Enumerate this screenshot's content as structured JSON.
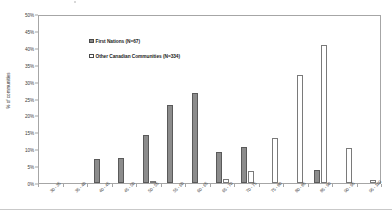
{
  "chart_data": {
    "type": "bar",
    "title": "",
    "subtitle": "",
    "xlabel": "",
    "ylabel": "% of communities",
    "ylim": [
      0,
      50
    ],
    "ytick_labels": [
      "0%",
      "5%",
      "10%",
      "15%",
      "20%",
      "25%",
      "30%",
      "35%",
      "40%",
      "45%",
      "50%"
    ],
    "ytick_values": [
      0,
      5,
      10,
      15,
      20,
      25,
      30,
      35,
      40,
      45,
      50
    ],
    "grid": false,
    "legend_position": "top-left",
    "categories": [
      "30 - 35",
      "35 - 40",
      "40 - 45",
      "45 - 50",
      "50 - 55",
      "55 - 60",
      "60 - 65",
      "65 - 70",
      "70 - 75",
      "75 - 80",
      "80 - 85",
      "85 - 90",
      "90 - 95",
      "95 - 100"
    ],
    "series": [
      {
        "name": "First Nations (N=67)",
        "color": "#8c8c8c",
        "values": [
          0,
          0,
          7.2,
          7.3,
          14.1,
          23.1,
          26.5,
          9.1,
          10.8,
          0,
          0,
          3.8,
          0,
          0
        ]
      },
      {
        "name": "Other Canadian Communities (N=334)",
        "color": "#ffffff",
        "values": [
          0,
          0,
          0,
          0,
          0.5,
          0,
          0,
          1.1,
          3.5,
          13.2,
          32.0,
          40.8,
          10.4,
          1.0
        ]
      }
    ]
  },
  "legend": {
    "items": [
      {
        "label": "First Nations (N=67)",
        "swatch": "filled-gray"
      },
      {
        "label": "Other Canadian Communities (N=334)",
        "swatch": "outlined-white"
      }
    ]
  },
  "axes": {
    "y_title": "% of communities"
  }
}
